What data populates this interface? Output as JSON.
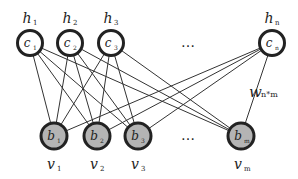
{
  "diagram": {
    "type": "bipartite-graph",
    "hidden_layer": {
      "nodes": [
        {
          "label": "h",
          "label_sub": "1",
          "inner": "c",
          "inner_sub": "1",
          "x": 30,
          "y": 43
        },
        {
          "label": "h",
          "label_sub": "2",
          "inner": "c",
          "inner_sub": "2",
          "x": 70,
          "y": 43
        },
        {
          "label": "h",
          "label_sub": "3",
          "inner": "c",
          "inner_sub": "3",
          "x": 111,
          "y": 43
        },
        {
          "label": "h",
          "label_sub": "n",
          "inner": "c",
          "inner_sub": "n",
          "x": 272,
          "y": 43
        }
      ],
      "ellipsis": "…",
      "ellipsis_x": 188
    },
    "visible_layer": {
      "nodes": [
        {
          "label": "v",
          "label_sub": "1",
          "inner": "b",
          "inner_sub": "1",
          "x": 54,
          "y": 136
        },
        {
          "label": "v",
          "label_sub": "2",
          "inner": "b",
          "inner_sub": "2",
          "x": 97,
          "y": 136
        },
        {
          "label": "v",
          "label_sub": "3",
          "inner": "b",
          "inner_sub": "3",
          "x": 138,
          "y": 136
        },
        {
          "label": "v",
          "label_sub": "m",
          "inner": "b",
          "inner_sub": "m",
          "x": 241,
          "y": 136
        }
      ],
      "ellipsis": "…",
      "ellipsis_x": 188
    },
    "weight_label": {
      "symbol": "w",
      "subscript": "n*m"
    },
    "colors": {
      "hidden_fill": "#ffffff",
      "visible_fill": "#b4b4b4",
      "stroke": "#222222",
      "edge": "#333333"
    }
  }
}
